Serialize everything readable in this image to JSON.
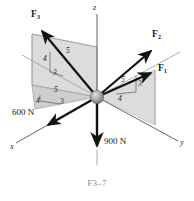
{
  "figure": {
    "caption": "F3–7",
    "caption_color": "#8d8d8d",
    "background": "#ffffff",
    "plane_fill": "#d9d9d9",
    "plane_stroke": "#8a8a8a",
    "vector_color": "#111111",
    "axis_color": "#555555",
    "sphere_color": "#9a9a9a"
  },
  "axes": [
    {
      "name": "x-axis",
      "label": "x"
    },
    {
      "name": "y-axis",
      "label": "y"
    },
    {
      "name": "z-axis",
      "label": "z"
    }
  ],
  "forces": [
    {
      "id": "F1",
      "label": "F",
      "sub": "1",
      "slope": {
        "hyp": "5",
        "vert": "3",
        "horiz": "4"
      }
    },
    {
      "id": "F2",
      "label": "F",
      "sub": "2",
      "slope": null
    },
    {
      "id": "F3",
      "label": "F",
      "sub": "3",
      "slope": {
        "hyp": "5",
        "vert": "4",
        "horiz": "3"
      }
    }
  ],
  "magnitudes": [
    {
      "id": "force-600",
      "text": "600 N"
    },
    {
      "id": "force-900",
      "text": "900 N"
    }
  ],
  "triangles": {
    "f3_vertical": {
      "hyp": "5",
      "vert": "4",
      "horiz": "3"
    },
    "f3_horizontal": {
      "hyp": "5",
      "horiz_a": "4",
      "horiz_b": "3"
    },
    "f1_vertical": {
      "hyp": "5",
      "vert": "3",
      "horiz": "4"
    }
  }
}
